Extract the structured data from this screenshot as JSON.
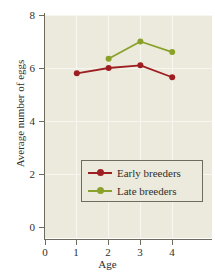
{
  "chart_data": {
    "type": "line",
    "title": "",
    "xlabel": "Age",
    "ylabel": "Average number of eggs",
    "x": [
      1,
      2,
      3,
      4
    ],
    "xlim": [
      0,
      4.6
    ],
    "ylim": [
      0,
      8
    ],
    "xticks": [
      "0",
      "1",
      "2",
      "3",
      "4"
    ],
    "yticks": [
      "0",
      "2",
      "4",
      "6",
      "8"
    ],
    "grid": true,
    "legend_position": "lower-right-inside",
    "series": [
      {
        "name": "Early breeders",
        "color": "#9e1f22",
        "marker": "circle",
        "values": [
          5.8,
          6.0,
          6.1,
          5.65
        ]
      },
      {
        "name": "Late breeders",
        "color": "#8aa12a",
        "marker": "circle",
        "values": [
          null,
          6.35,
          7.0,
          6.6
        ]
      }
    ]
  },
  "axes": {
    "xlabel": "Age",
    "ylabel": "Average number of eggs",
    "ytick_labels": [
      "8",
      "6",
      "4",
      "2",
      "0"
    ],
    "xtick_labels": [
      "0",
      "1",
      "2",
      "3",
      "4"
    ]
  },
  "legend": {
    "items": [
      {
        "label": "Early breeders",
        "color": "#9e1f22"
      },
      {
        "label": "Late breeders",
        "color": "#8aa12a"
      }
    ]
  },
  "colors": {
    "panel_background": "#eceadd",
    "gridline": "#f7f6ef",
    "axis": "#6d6a5e",
    "early_breeders": "#9e1f22",
    "late_breeders": "#8aa12a",
    "text": "#2f2e2b"
  }
}
